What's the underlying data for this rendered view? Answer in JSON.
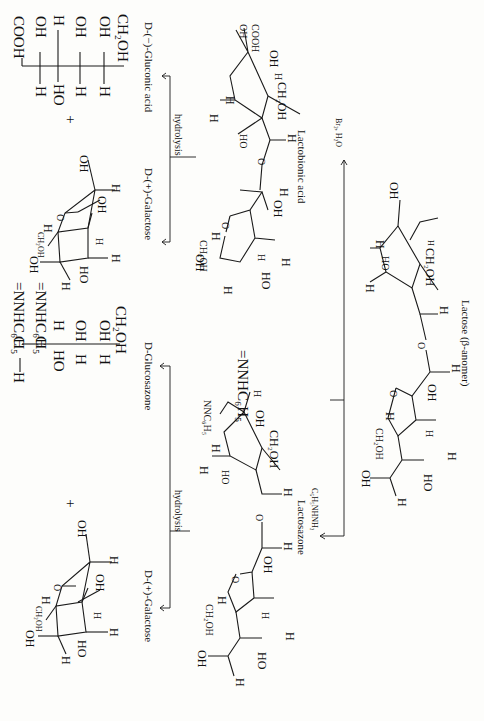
{
  "figure": {
    "orientation": "rotated 90 degrees clockwise",
    "compounds": {
      "lactose": {
        "label": "Lactose (β-anomer)"
      },
      "lactobionic_acid": {
        "label": "Lactobionic acid"
      },
      "lactosazone": {
        "label": "Lactosazone"
      },
      "galactose_top": {
        "label": "D-(+)-Galactose"
      },
      "galactose_bottom": {
        "label": "D-(+)-Galactose"
      },
      "gluconic_acid": {
        "label": "D-(−)-Gluconic acid",
        "fischer": [
          "COOH",
          "H—C—OH",
          "HO—C—H",
          "H—C—OH",
          "H—C—OH",
          "CH₂OH"
        ]
      },
      "glucosazone": {
        "label": "D-Glucosazone",
        "fischer": [
          "H—C=NNHC₆H₅",
          "C=NNHC₆H₅",
          "HO—C—H",
          "H—C—OH",
          "H—C—OH",
          "CH₂OH"
        ]
      }
    },
    "reagents": {
      "oxidation": "Br₂, H₂O",
      "osazone": "C₆H₅NHNH₂",
      "hydrolysis_top": "hydrolysis",
      "hydrolysis_bottom": "hydrolysis"
    },
    "symbols": {
      "plus": "+"
    },
    "atoms": {
      "OH": "OH",
      "HO": "HO",
      "H": "H",
      "O": "O",
      "CH2OH": "CH₂OH",
      "COOH": "COOH",
      "NNHC6H5": "=NNHC₆H₅",
      "NNC6H5": "NNC₆H₅",
      "C": "C"
    }
  }
}
